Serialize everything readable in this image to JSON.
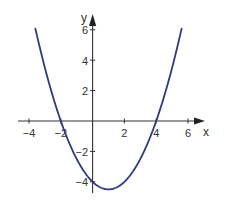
{
  "chart_data": {
    "type": "line",
    "title": "",
    "xlabel": "x",
    "ylabel": "y",
    "xlim": [
      -4.5,
      7
    ],
    "ylim": [
      -4.8,
      6.5
    ],
    "grid": false,
    "legend": null,
    "x_ticks": [
      -4,
      -2,
      2,
      4,
      6
    ],
    "x_tick_labels": [
      "−4",
      "−2",
      "2",
      "4",
      "6"
    ],
    "y_ticks": [
      6,
      4,
      2,
      -2,
      -4
    ],
    "y_tick_labels": [
      "6",
      "4",
      "2",
      "−2",
      "−4"
    ],
    "series": [
      {
        "name": "parabola",
        "function": "y = 0.5x^2 - x - 4",
        "color": "#2f3a7e",
        "x": [
          -3.6,
          -3,
          -2.5,
          -2,
          -1.5,
          -1,
          -0.5,
          0,
          0.5,
          1,
          1.5,
          2,
          2.5,
          3,
          3.5,
          4,
          4.5,
          5,
          5.6
        ],
        "y": [
          6.08,
          3.5,
          1.625,
          0,
          -1.375,
          -2.5,
          -3.375,
          -4,
          -4.375,
          -4.5,
          -4.375,
          -4,
          -3.375,
          -2.5,
          -1.375,
          0,
          1.625,
          3.5,
          6.08
        ]
      }
    ],
    "key_points": {
      "x_intercepts": [
        -2,
        4
      ],
      "y_intercept": -4,
      "vertex": [
        1,
        -4.5
      ]
    }
  },
  "labels": {
    "x_axis": "x",
    "y_axis": "y",
    "xt0": "−4",
    "xt1": "−2",
    "xt2": "2",
    "xt3": "4",
    "xt4": "6",
    "yt0": "6",
    "yt1": "4",
    "yt2": "2",
    "yt3": "−2",
    "yt4": "−4"
  }
}
